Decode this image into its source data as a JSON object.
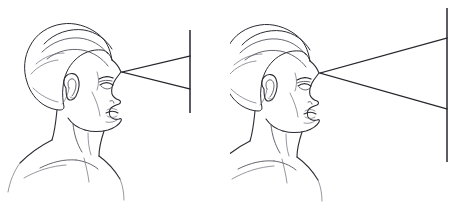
{
  "document": {
    "title": "Visual angle comparison diagram",
    "description": "Two identical line-art profile drawings of a human head facing right, each projecting a viewing cone from the eye to a vertical screen line.",
    "background_color": "#ffffff",
    "ink_color": "#2b2b33",
    "ray_color": "#25252c",
    "width": 460,
    "height": 209
  },
  "figures": [
    {
      "id": "left-figure",
      "label": "Near screen",
      "head": {
        "facing": "right",
        "eye_point": {
          "x": 122,
          "y": 72
        },
        "cropped_at_left_edge": false
      },
      "cone": {
        "apex": {
          "x": 122,
          "y": 72
        },
        "upper_ray_end": {
          "x": 190,
          "y": 56
        },
        "lower_ray_end": {
          "x": 190,
          "y": 89
        },
        "aperture_px": 33
      },
      "screen": {
        "x": 190,
        "top_y": 30,
        "bottom_y": 113,
        "height_px": 83
      }
    },
    {
      "id": "right-figure",
      "label": "Far screen",
      "head": {
        "facing": "right",
        "eye_point": {
          "x": 320,
          "y": 73
        },
        "cropped_at_left_edge": true
      },
      "cone": {
        "apex": {
          "x": 320,
          "y": 73
        },
        "upper_ray_end": {
          "x": 447,
          "y": 38
        },
        "lower_ray_end": {
          "x": 447,
          "y": 109
        },
        "aperture_px": 71
      },
      "screen": {
        "x": 447,
        "top_y": 8,
        "bottom_y": 162,
        "height_px": 154
      }
    }
  ],
  "chart_data": {
    "type": "diagram",
    "series": [
      {
        "name": "Near screen",
        "screen_height_px": 83,
        "cone_aperture_px": 33,
        "eye_to_screen_px": 68
      },
      {
        "name": "Far screen",
        "screen_height_px": 154,
        "cone_aperture_px": 71,
        "eye_to_screen_px": 127
      }
    ],
    "annotations": [],
    "legend": "none",
    "grid": false
  }
}
